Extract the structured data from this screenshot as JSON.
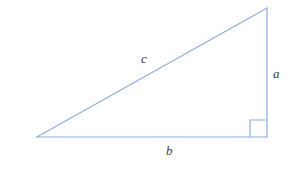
{
  "diagram": {
    "type": "right-triangle",
    "background_color": "#ffffff",
    "stroke_color": "#8badde",
    "stroke_width": 1.2,
    "label_color": "#3b3b3b",
    "vertices": {
      "left": {
        "x": 37,
        "y": 137
      },
      "bottom_right": {
        "x": 267,
        "y": 137
      },
      "top_right": {
        "x": 267,
        "y": 8
      }
    },
    "right_angle_marker": {
      "name": "right-angle-square",
      "x": 250,
      "y": 120,
      "size": 17
    },
    "labels": {
      "hypotenuse": "c",
      "vertical_leg": "a",
      "horizontal_leg": "b"
    }
  }
}
